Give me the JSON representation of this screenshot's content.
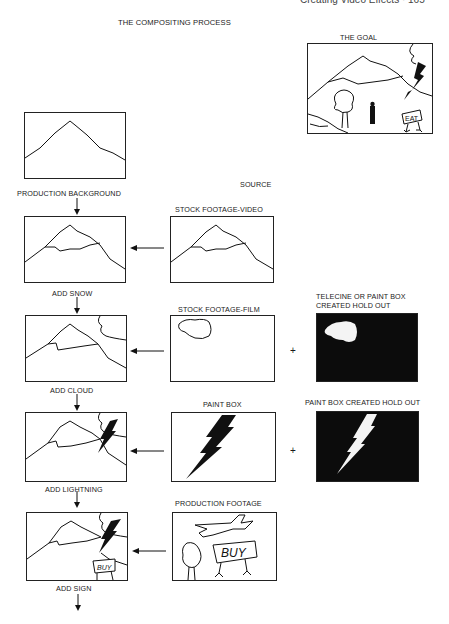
{
  "page": {
    "running_header": "Creating Video Effects · 165",
    "title": "THE COMPOSITING PROCESS",
    "source_heading": "SOURCE"
  },
  "goal": {
    "label": "THE GOAL",
    "sign_text": "EAT"
  },
  "steps": [
    {
      "result_label": "PRODUCTION BACKGROUND"
    },
    {
      "result_label": "ADD SNOW",
      "source_label": "STOCK FOOTAGE-VIDEO"
    },
    {
      "result_label": "ADD CLOUD",
      "source_label": "STOCK FOOTAGE-FILM",
      "holdout_label_line1": "TELECINE  OR  PAINT BOX",
      "holdout_label_line2": "CREATED HOLD OUT"
    },
    {
      "result_label": "ADD LIGHTNING",
      "source_label": "PAINT BOX",
      "holdout_label_line1": "PAINT BOX CREATED HOLD OUT"
    },
    {
      "result_label": "ADD SIGN",
      "source_label": "PRODUCTION FOOTAGE",
      "sign_text": "BUY"
    }
  ],
  "symbols": {
    "plus": "+"
  }
}
